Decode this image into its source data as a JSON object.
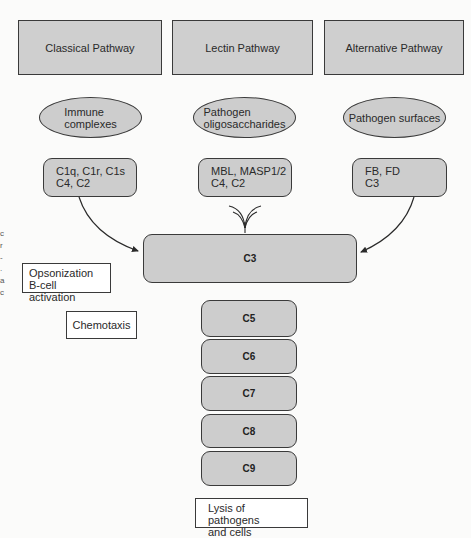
{
  "pathways": [
    {
      "label": "Classical Pathway"
    },
    {
      "label": "Lectin Pathway"
    },
    {
      "label": "Alternative Pathway"
    }
  ],
  "triggers": [
    {
      "line1": "Immune",
      "line2": "complexes"
    },
    {
      "line1": "Pathogen",
      "line2": "oligosaccharides"
    },
    {
      "line1": "Pathogen surfaces",
      "line2": ""
    }
  ],
  "components": [
    {
      "line1": "C1q, C1r, C1s",
      "line2": "C4, C2"
    },
    {
      "line1": "MBL, MASP1/2",
      "line2": "C4, C2"
    },
    {
      "line1": "FB, FD",
      "line2": "C3"
    }
  ],
  "central": {
    "label": "C3"
  },
  "terminal": [
    {
      "label": "C5"
    },
    {
      "label": "C6"
    },
    {
      "label": "C7"
    },
    {
      "label": "C8"
    },
    {
      "label": "C9"
    }
  ],
  "effects": {
    "opsonization": {
      "line1": "Opsonization",
      "line2": "B-cell activation"
    },
    "chemotaxis": {
      "label": "Chemotaxis"
    },
    "lysis": {
      "line1": "Lysis of pathogens",
      "line2": "and cells"
    }
  },
  "edge_fragments": [
    "c",
    "r",
    "-",
    ".",
    "a",
    "c"
  ],
  "colors": {
    "box_fill": "#cdcdcd",
    "stroke": "#3a3a3a",
    "background": "#fbfbfa"
  }
}
